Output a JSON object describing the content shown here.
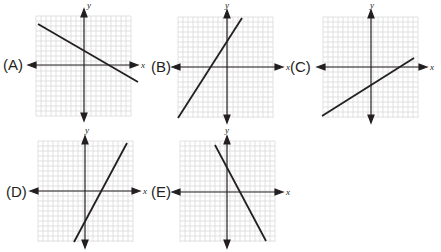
{
  "colors": {
    "grid": "#d6d6d6",
    "axis": "#231f20",
    "line": "#231f20",
    "background": "#ffffff"
  },
  "axis_labels": {
    "x": "x",
    "y": "y"
  },
  "options": [
    {
      "id": "A",
      "label": "(A)",
      "slope_sign": "negative",
      "y_intercept_sign": "positive",
      "x_intercept_sign": "positive"
    },
    {
      "id": "B",
      "label": "(B)",
      "slope_sign": "positive",
      "y_intercept_sign": "positive",
      "x_intercept_sign": "negative"
    },
    {
      "id": "C",
      "label": "(C)",
      "slope_sign": "positive",
      "y_intercept_sign": "negative",
      "x_intercept_sign": "positive"
    },
    {
      "id": "D",
      "label": "(D)",
      "slope_sign": "positive",
      "y_intercept_sign": "negative",
      "x_intercept_sign": "positive"
    },
    {
      "id": "E",
      "label": "(E)",
      "slope_sign": "negative",
      "y_intercept_sign": "positive",
      "x_intercept_sign": "positive"
    }
  ]
}
